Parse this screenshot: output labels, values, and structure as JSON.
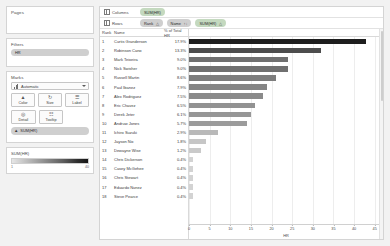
{
  "sidebar": {
    "pages": {
      "title": "Pages"
    },
    "filters": {
      "title": "Filters",
      "items": [
        {
          "label": "HR"
        }
      ]
    },
    "marks": {
      "title": "Marks",
      "type_selector": {
        "label": "Automatic",
        "icon": "bar-chart-icon",
        "caret": "chevron-down-icon"
      },
      "buttons": [
        {
          "label": "Color",
          "icon": "color-palette-icon",
          "glyph": "▲"
        },
        {
          "label": "Size",
          "icon": "size-icon",
          "glyph": "↻"
        },
        {
          "label": "Label",
          "icon": "label-icon",
          "glyph": "☰"
        },
        {
          "label": "Detail",
          "icon": "detail-icon",
          "glyph": "◎"
        },
        {
          "label": "Tooltip",
          "icon": "tooltip-icon",
          "glyph": "☷"
        }
      ],
      "encodings": [
        {
          "icon": "color-palette-icon",
          "glyph": "▲",
          "label": "SUM(HR)"
        }
      ]
    },
    "legend": {
      "title": "SUM(HR)",
      "min": "1",
      "max": "40"
    }
  },
  "shelves": {
    "columns": {
      "label": "Columns",
      "icon": "columns-grid-icon",
      "pills": [
        {
          "label": "SUM(HR)",
          "color": "green"
        }
      ]
    },
    "rows": {
      "label": "Rows",
      "icon": "rows-grid-icon",
      "pills": [
        {
          "label": "Rank",
          "sort": "△",
          "color": "grey"
        },
        {
          "label": "Name",
          "sort": "↑↓",
          "color": "grey"
        },
        {
          "label": "SUM(HR)",
          "sort": "△",
          "color": "green"
        }
      ]
    }
  },
  "table": {
    "headers": {
      "rank": "Rank",
      "name": "Name",
      "pct": "% of Total HR"
    },
    "rows": [
      {
        "rank": "1",
        "name": "Curtis Granderson",
        "pct": "17.9%"
      },
      {
        "rank": "2",
        "name": "Robinson Cano",
        "pct": "13.3%"
      },
      {
        "rank": "3",
        "name": "Mark Teixeira",
        "pct": "9.0%"
      },
      {
        "rank": "4",
        "name": "Nick Swisher",
        "pct": "9.0%"
      },
      {
        "rank": "5",
        "name": "Russell Martin",
        "pct": "8.6%"
      },
      {
        "rank": "6",
        "name": "Paul Ibanez",
        "pct": "7.9%"
      },
      {
        "rank": "7",
        "name": "Alex Rodriguez",
        "pct": "7.5%"
      },
      {
        "rank": "8",
        "name": "Eric Chavez",
        "pct": "6.5%"
      },
      {
        "rank": "9",
        "name": "Derek Jeter",
        "pct": "6.1%"
      },
      {
        "rank": "10",
        "name": "Andruw Jones",
        "pct": "5.7%"
      },
      {
        "rank": "11",
        "name": "Ichiro Suzuki",
        "pct": "2.9%"
      },
      {
        "rank": "12",
        "name": "Jayson Nix",
        "pct": "1.8%"
      },
      {
        "rank": "13",
        "name": "Dewayne Wise",
        "pct": "1.2%"
      },
      {
        "rank": "14",
        "name": "Chris Dickerson",
        "pct": "0.4%"
      },
      {
        "rank": "15",
        "name": "Casey McGehee",
        "pct": "0.4%"
      },
      {
        "rank": "16",
        "name": "Chris Stewart",
        "pct": "0.4%"
      },
      {
        "rank": "17",
        "name": "Eduardo Nunez",
        "pct": "0.4%"
      },
      {
        "rank": "18",
        "name": "Steve Pearce",
        "pct": "0.4%"
      }
    ]
  },
  "chart_data": {
    "type": "bar",
    "title": "",
    "xlabel": "HR",
    "ylabel": "",
    "orientation": "horizontal",
    "xlim": [
      0,
      47
    ],
    "ticks": [
      0,
      5,
      10,
      15,
      20,
      25,
      30,
      35,
      40,
      45
    ],
    "grid": true,
    "legend": "none",
    "categories": [
      "Curtis Granderson",
      "Robinson Cano",
      "Mark Teixeira",
      "Nick Swisher",
      "Russell Martin",
      "Paul Ibanez",
      "Alex Rodriguez",
      "Eric Chavez",
      "Derek Jeter",
      "Andruw Jones",
      "Ichiro Suzuki",
      "Jayson Nix",
      "Dewayne Wise",
      "Chris Dickerson",
      "Casey McGehee",
      "Chris Stewart",
      "Eduardo Nunez",
      "Steve Pearce"
    ],
    "values": [
      43,
      32,
      24,
      24,
      21,
      19,
      18,
      16,
      15,
      14,
      7,
      4,
      3,
      1,
      1,
      1,
      1,
      1
    ],
    "value_label": "HR",
    "percent_of_total": [
      "17.9%",
      "13.3%",
      "9.0%",
      "9.0%",
      "8.6%",
      "7.9%",
      "7.5%",
      "6.5%",
      "6.1%",
      "5.7%",
      "2.9%",
      "1.8%",
      "1.2%",
      "0.4%",
      "0.4%",
      "0.4%",
      "0.4%",
      "0.4%"
    ]
  }
}
